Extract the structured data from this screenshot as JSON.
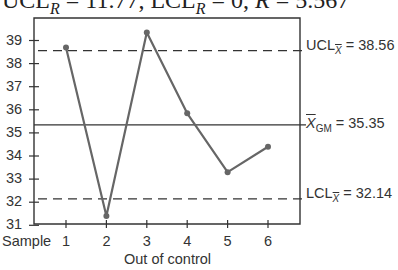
{
  "caption": {
    "ucl_r_label": "UCL",
    "ucl_r_sub": "R",
    "ucl_r_value": " = 11.77, ",
    "lcl_r_label": "LCL",
    "lcl_r_sub": "R",
    "lcl_r_value": " = 0, ",
    "rbar_label": "R",
    "rbar_value": " = 5.567"
  },
  "labels": {
    "ucl_prefix": "UCL",
    "ucl_sub": "X",
    "ucl_value": " = 38.56",
    "cl_prefix": "X",
    "cl_sub": "GM",
    "cl_value": " = 35.35",
    "lcl_prefix": "LCL",
    "lcl_sub": "X",
    "lcl_value": " = 32.14",
    "x_axis_prefix": "Sample",
    "annotation": "Out of control"
  },
  "colors": {
    "line": "#666666",
    "axis": "#333333",
    "text": "#333333"
  },
  "chart_data": {
    "type": "line",
    "title": "",
    "xlabel": "Sample",
    "ylabel": "",
    "x": [
      1,
      2,
      3,
      4,
      5,
      6
    ],
    "values": [
      38.7,
      31.4,
      39.35,
      35.85,
      33.3,
      34.4
    ],
    "ylim": [
      31,
      39.8
    ],
    "xlim": [
      0.2,
      6.8
    ],
    "yticks": [
      31,
      32,
      33,
      34,
      35,
      36,
      37,
      38,
      39
    ],
    "xticks": [
      1,
      2,
      3,
      4,
      5,
      6
    ],
    "reference_lines": [
      {
        "name": "UCL_X",
        "value": 38.56,
        "style": "dashed",
        "label": "UCL X = 38.56"
      },
      {
        "name": "X_GM",
        "value": 35.35,
        "style": "solid",
        "label": "X GM = 35.35"
      },
      {
        "name": "LCL_X",
        "value": 32.14,
        "style": "dashed",
        "label": "LCL X = 32.14"
      }
    ],
    "annotations": [
      "Out of control"
    ],
    "grid": false,
    "legend": "none"
  }
}
